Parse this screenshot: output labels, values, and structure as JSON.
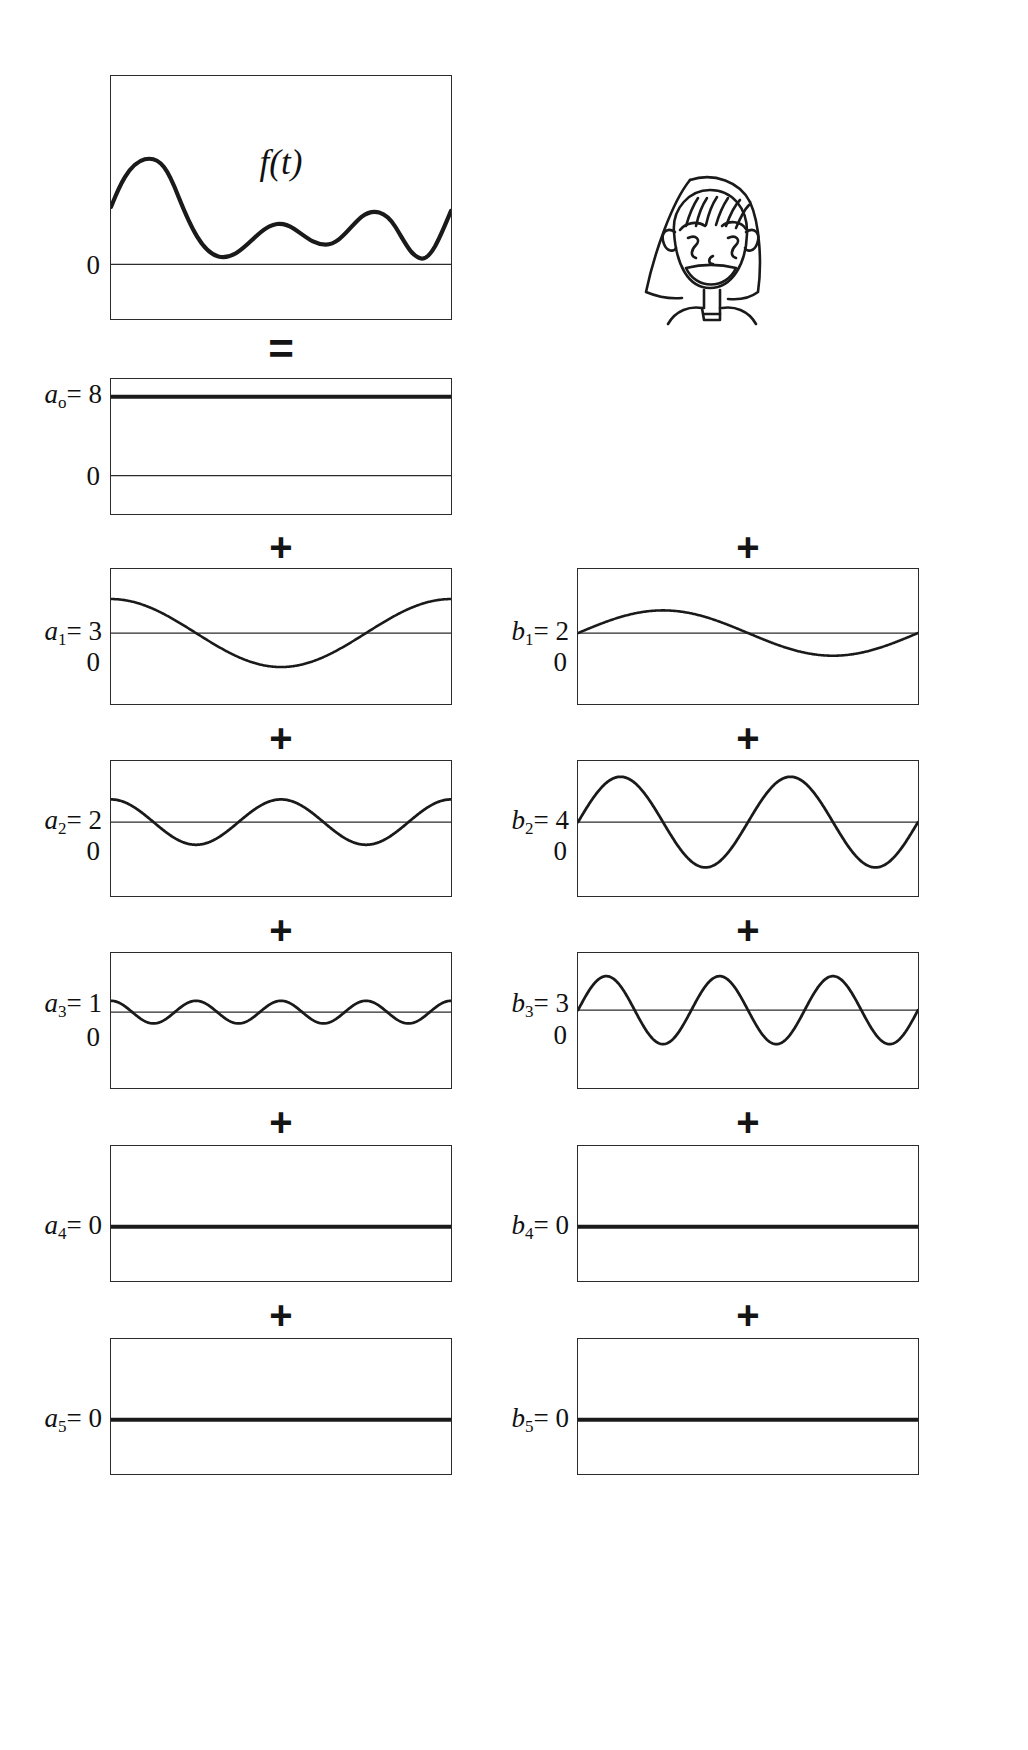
{
  "figure": {
    "signal_label": "f(t)",
    "operators": {
      "equals": "=",
      "plus": "+"
    },
    "zero_tick": "0"
  },
  "left_column": {
    "terms": [
      {
        "id": "f",
        "symbol": "",
        "subscript": "",
        "equals": "",
        "value": "",
        "label": "f(t)",
        "kind": "signal"
      },
      {
        "id": "a0",
        "symbol": "a",
        "subscript": "o",
        "equals": "=",
        "value": "8",
        "label": "a_o = 8",
        "kind": "dc",
        "amplitude": 8,
        "cycles": 0,
        "phase": "cos"
      },
      {
        "id": "a1",
        "symbol": "a",
        "subscript": "1",
        "equals": "=",
        "value": "3",
        "label": "a_1 = 3",
        "kind": "cosine",
        "amplitude": 3,
        "cycles": 1,
        "phase": "cos"
      },
      {
        "id": "a2",
        "symbol": "a",
        "subscript": "2",
        "equals": "=",
        "value": "2",
        "label": "a_2 = 2",
        "kind": "cosine",
        "amplitude": 2,
        "cycles": 2,
        "phase": "cos"
      },
      {
        "id": "a3",
        "symbol": "a",
        "subscript": "3",
        "equals": "=",
        "value": "1",
        "label": "a_3 = 1",
        "kind": "cosine",
        "amplitude": 1,
        "cycles": 4,
        "phase": "cos"
      },
      {
        "id": "a4",
        "symbol": "a",
        "subscript": "4",
        "equals": "=",
        "value": "0",
        "label": "a_4 = 0",
        "kind": "zero",
        "amplitude": 0,
        "cycles": 0,
        "phase": "cos"
      },
      {
        "id": "a5",
        "symbol": "a",
        "subscript": "5",
        "equals": "=",
        "value": "0",
        "label": "a_5 = 0",
        "kind": "zero",
        "amplitude": 0,
        "cycles": 0,
        "phase": "cos"
      }
    ]
  },
  "right_column": {
    "doodle": "smiling-girl-face-sketch",
    "terms": [
      {
        "id": "b1",
        "symbol": "b",
        "subscript": "1",
        "equals": "=",
        "value": "2",
        "label": "b_1 = 2",
        "kind": "sine",
        "amplitude": 2,
        "cycles": 1,
        "phase": "sin"
      },
      {
        "id": "b2",
        "symbol": "b",
        "subscript": "2",
        "equals": "=",
        "value": "4",
        "label": "b_2 = 4",
        "kind": "sine",
        "amplitude": 4,
        "cycles": 2,
        "phase": "sin"
      },
      {
        "id": "b3",
        "symbol": "b",
        "subscript": "3",
        "equals": "=",
        "value": "3",
        "label": "b_3 = 3",
        "kind": "sine",
        "amplitude": 3,
        "cycles": 3,
        "phase": "sin"
      },
      {
        "id": "b4",
        "symbol": "b",
        "subscript": "4",
        "equals": "=",
        "value": "0",
        "label": "b_4 = 0",
        "kind": "zero",
        "amplitude": 0,
        "cycles": 0,
        "phase": "sin"
      },
      {
        "id": "b5",
        "symbol": "b",
        "subscript": "5",
        "equals": "=",
        "value": "0",
        "label": "b_5 = 0",
        "kind": "zero",
        "amplitude": 0,
        "cycles": 0,
        "phase": "sin"
      }
    ]
  },
  "chart_data": {
    "type": "line",
    "xlabel": "",
    "ylabel": "",
    "grid": false,
    "legend": "none",
    "series": [
      {
        "name": "f(t)",
        "role": "composite signal",
        "zero_label": "0",
        "cycles": null,
        "amplitude": null
      },
      {
        "name": "a_o = 8",
        "role": "DC component",
        "zero_label": "0",
        "cycles": 0,
        "amplitude": 8
      },
      {
        "name": "a_1 = 3",
        "role": "cosine harmonic 1",
        "zero_label": "0",
        "cycles": 1,
        "amplitude": 3
      },
      {
        "name": "a_2 = 2",
        "role": "cosine harmonic 2",
        "zero_label": "0",
        "cycles": 2,
        "amplitude": 2
      },
      {
        "name": "a_3 = 1",
        "role": "cosine harmonic 3",
        "zero_label": "0",
        "cycles": 4,
        "amplitude": 1
      },
      {
        "name": "a_4 = 0",
        "role": "cosine harmonic 4",
        "zero_label": "",
        "cycles": 0,
        "amplitude": 0
      },
      {
        "name": "a_5 = 0",
        "role": "cosine harmonic 5",
        "zero_label": "",
        "cycles": 0,
        "amplitude": 0
      },
      {
        "name": "b_1 = 2",
        "role": "sine harmonic 1",
        "zero_label": "0",
        "cycles": 1,
        "amplitude": 2
      },
      {
        "name": "b_2 = 4",
        "role": "sine harmonic 2",
        "zero_label": "0",
        "cycles": 2,
        "amplitude": 4
      },
      {
        "name": "b_3 = 3",
        "role": "sine harmonic 3",
        "zero_label": "0",
        "cycles": 3,
        "amplitude": 3
      },
      {
        "name": "b_4 = 0",
        "role": "sine harmonic 4",
        "zero_label": "",
        "cycles": 0,
        "amplitude": 0
      },
      {
        "name": "b_5 = 0",
        "role": "sine harmonic 5",
        "zero_label": "",
        "cycles": 0,
        "amplitude": 0
      }
    ],
    "coefficients": {
      "a": {
        "o": 8,
        "1": 3,
        "2": 2,
        "3": 1,
        "4": 0,
        "5": 0
      },
      "b": {
        "1": 2,
        "2": 4,
        "3": 3,
        "4": 0,
        "5": 0
      }
    }
  }
}
